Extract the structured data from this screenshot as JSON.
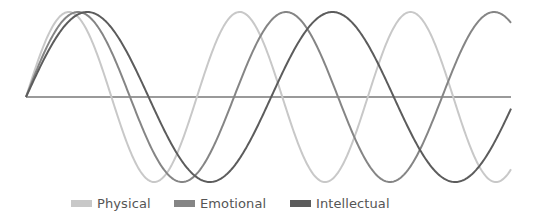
{
  "chart_data": {
    "type": "line",
    "title": "",
    "xlabel": "",
    "ylabel": "",
    "x_range_days": [
      0,
      65.3
    ],
    "ylim": [
      -1,
      1
    ],
    "grid": false,
    "axis": {
      "zero_line": true,
      "color": "#9a9a9a"
    },
    "legend_position": "bottom",
    "series": [
      {
        "name": "Physical",
        "period_days": 23,
        "phase_days": 0,
        "color": "#c8c8c8"
      },
      {
        "name": "Emotional",
        "period_days": 28,
        "phase_days": 0,
        "color": "#858585"
      },
      {
        "name": "Intellectual",
        "period_days": 33,
        "phase_days": 0,
        "color": "#5c5c5c"
      }
    ],
    "function": "sin(2*pi*t/period)"
  },
  "layout": {
    "origin_x": 26,
    "zero_y": 97,
    "end_x": 511,
    "amplitude_px": 85,
    "px_per_day": 7.43
  },
  "legend": {
    "items": [
      {
        "label": "Physical",
        "color": "#c8c8c8",
        "x": 71
      },
      {
        "label": "Emotional",
        "color": "#858585",
        "x": 174
      },
      {
        "label": "Intellectual",
        "color": "#5c5c5c",
        "x": 290
      }
    ]
  }
}
